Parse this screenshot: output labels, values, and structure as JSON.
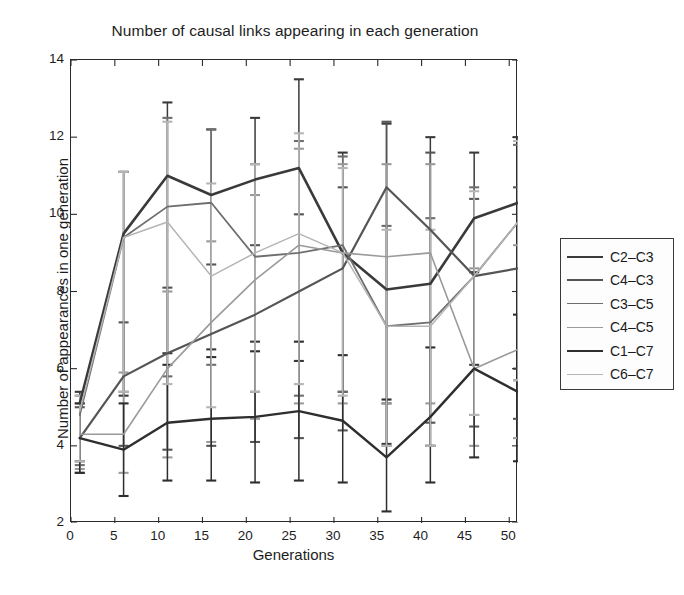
{
  "chart_data": {
    "type": "line",
    "title": "Number of causal links appearing in each generation",
    "xlabel": "Generations",
    "ylabel": "Number of appearances in one generation",
    "xlim": [
      0,
      51
    ],
    "ylim": [
      2,
      14
    ],
    "xticks": [
      0,
      5,
      10,
      15,
      20,
      25,
      30,
      35,
      40,
      45,
      50
    ],
    "yticks": [
      2,
      4,
      6,
      8,
      10,
      12,
      14
    ],
    "grid": false,
    "legend_position": "right-outside",
    "error_bars": true,
    "x": [
      1,
      6,
      11,
      16,
      21,
      26,
      31,
      36,
      41,
      46,
      51
    ],
    "series": [
      {
        "name": "C2-C3",
        "color": "#3a3a3a",
        "values": [
          5.1,
          9.5,
          11.0,
          10.5,
          10.9,
          11.2,
          9.0,
          8.05,
          8.2,
          9.9,
          10.3
        ],
        "err_low": [
          1.5,
          4.2,
          4.6,
          4.0,
          4.2,
          5.0,
          3.6,
          4.0,
          4.2,
          3.8,
          4.3
        ],
        "err_high": [
          0.3,
          1.6,
          1.9,
          1.7,
          1.6,
          2.3,
          2.6,
          4.3,
          3.8,
          1.7,
          1.7
        ]
      },
      {
        "name": "C4-C3",
        "color": "#555555",
        "values": [
          4.2,
          5.8,
          6.4,
          6.9,
          7.4,
          8.0,
          8.6,
          10.7,
          9.6,
          8.4,
          8.6
        ],
        "err_low": [
          0.9,
          1.8,
          2.5,
          2.9,
          3.3,
          3.8,
          4.2,
          5.6,
          5.0,
          3.9,
          3.9
        ],
        "err_high": [
          0.8,
          1.4,
          1.7,
          1.8,
          1.8,
          2.0,
          2.1,
          1.7,
          2.0,
          2.0,
          2.1
        ]
      },
      {
        "name": "C3-C5",
        "color": "#6e6e6e",
        "values": [
          4.8,
          9.4,
          10.2,
          10.3,
          8.9,
          9.0,
          9.2,
          7.1,
          7.2,
          8.4,
          9.8
        ],
        "err_low": [
          1.3,
          4.0,
          4.4,
          4.2,
          3.5,
          3.7,
          3.8,
          3.1,
          3.2,
          3.6,
          4.1
        ],
        "err_high": [
          0.5,
          1.7,
          2.3,
          1.9,
          2.4,
          2.9,
          2.3,
          2.6,
          2.7,
          2.3,
          2.0
        ]
      },
      {
        "name": "C4-C5",
        "color": "#9a9a9a",
        "values": [
          4.3,
          4.3,
          6.0,
          7.2,
          8.3,
          9.2,
          9.0,
          8.9,
          9.0,
          6.0,
          6.5
        ],
        "err_low": [
          0.9,
          1.0,
          2.3,
          3.1,
          3.6,
          4.1,
          3.9,
          3.8,
          3.9,
          2.0,
          2.3
        ],
        "err_high": [
          0.8,
          1.6,
          2.0,
          2.1,
          2.2,
          2.5,
          2.3,
          2.4,
          2.3,
          2.6,
          2.7
        ]
      },
      {
        "name": "C1-C7",
        "color": "#2e2e2e",
        "values": [
          4.2,
          3.9,
          4.6,
          4.7,
          4.75,
          4.9,
          4.65,
          3.7,
          4.75,
          6.0,
          5.4
        ],
        "err_low": [
          0.9,
          1.2,
          1.5,
          1.6,
          1.7,
          1.8,
          1.6,
          1.4,
          1.7,
          2.3,
          1.8
        ],
        "err_high": [
          0.9,
          1.2,
          1.5,
          1.6,
          1.7,
          1.8,
          1.7,
          1.5,
          1.8,
          2.5,
          2.0
        ]
      },
      {
        "name": "C6-C7",
        "color": "#b5b5b5",
        "values": [
          4.9,
          9.4,
          9.8,
          8.4,
          9.0,
          9.5,
          9.0,
          7.1,
          7.1,
          8.4,
          9.8
        ],
        "err_low": [
          1.3,
          4.0,
          4.2,
          3.4,
          3.6,
          3.9,
          3.7,
          3.1,
          3.1,
          3.6,
          4.1
        ],
        "err_high": [
          0.4,
          1.7,
          2.6,
          2.4,
          2.3,
          2.6,
          2.2,
          2.5,
          2.5,
          2.2,
          2.1
        ]
      }
    ]
  },
  "legend": {
    "items": [
      {
        "label": "C2–C3",
        "color": "#3a3a3a",
        "width": 2.6
      },
      {
        "label": "C4–C3",
        "color": "#555555",
        "width": 2.2
      },
      {
        "label": "C3–C5",
        "color": "#6e6e6e",
        "width": 1.8
      },
      {
        "label": "C4–C5",
        "color": "#9a9a9a",
        "width": 1.6
      },
      {
        "label": "C1–C7",
        "color": "#2e2e2e",
        "width": 2.4
      },
      {
        "label": "C6–C7",
        "color": "#b5b5b5",
        "width": 1.5
      }
    ]
  }
}
